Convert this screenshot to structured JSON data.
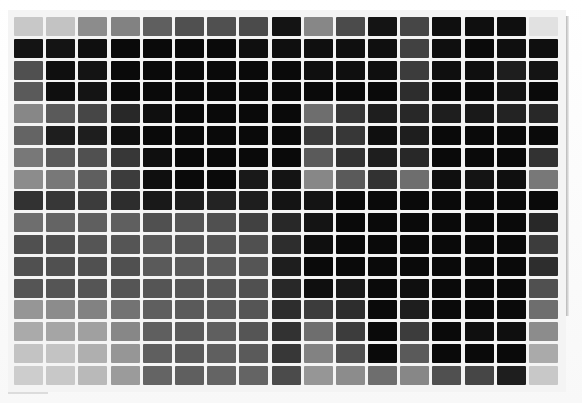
{
  "image": {
    "description": "Grayscale photograph of a printed color chart: a 17 x 17 grid of swatches on white paper",
    "rows": 17,
    "columns": 17,
    "background": "#f6f6f6",
    "gutter_color": "#f4f4f4"
  },
  "swatches": [
    [
      200,
      195,
      140,
      130,
      95,
      80,
      80,
      75,
      20,
      135,
      75,
      20,
      70,
      15,
      15,
      15,
      225
    ],
    [
      20,
      20,
      15,
      10,
      10,
      10,
      10,
      15,
      15,
      15,
      15,
      15,
      65,
      15,
      10,
      15,
      15
    ],
    [
      80,
      15,
      20,
      10,
      10,
      10,
      10,
      10,
      10,
      15,
      15,
      15,
      60,
      15,
      15,
      30,
      20
    ],
    [
      90,
      15,
      20,
      10,
      10,
      10,
      10,
      10,
      10,
      10,
      10,
      10,
      45,
      10,
      10,
      20,
      10
    ],
    [
      135,
      90,
      70,
      40,
      15,
      10,
      10,
      10,
      10,
      110,
      55,
      30,
      40,
      30,
      25,
      35,
      40
    ],
    [
      100,
      30,
      30,
      15,
      10,
      10,
      10,
      10,
      10,
      60,
      55,
      15,
      30,
      10,
      10,
      10,
      10
    ],
    [
      120,
      90,
      80,
      55,
      15,
      10,
      10,
      10,
      10,
      90,
      50,
      30,
      40,
      10,
      10,
      10,
      50
    ],
    [
      140,
      120,
      95,
      60,
      15,
      10,
      10,
      25,
      20,
      135,
      90,
      50,
      110,
      15,
      20,
      15,
      120
    ],
    [
      50,
      55,
      60,
      45,
      25,
      30,
      35,
      30,
      20,
      20,
      10,
      10,
      10,
      10,
      10,
      10,
      10
    ],
    [
      110,
      100,
      95,
      95,
      80,
      85,
      80,
      65,
      40,
      20,
      10,
      10,
      10,
      10,
      10,
      10,
      40
    ],
    [
      80,
      80,
      85,
      85,
      90,
      85,
      85,
      80,
      45,
      15,
      10,
      10,
      10,
      10,
      10,
      10,
      60
    ],
    [
      80,
      80,
      80,
      80,
      90,
      90,
      90,
      85,
      30,
      10,
      10,
      10,
      10,
      10,
      10,
      10,
      45
    ],
    [
      85,
      85,
      85,
      85,
      85,
      85,
      85,
      80,
      40,
      15,
      25,
      10,
      15,
      10,
      10,
      10,
      80
    ],
    [
      150,
      140,
      130,
      115,
      95,
      90,
      90,
      85,
      45,
      60,
      45,
      10,
      30,
      10,
      10,
      10,
      110
    ],
    [
      170,
      165,
      160,
      135,
      95,
      90,
      95,
      85,
      50,
      110,
      60,
      10,
      60,
      10,
      15,
      15,
      140
    ],
    [
      195,
      195,
      175,
      150,
      95,
      90,
      95,
      90,
      55,
      130,
      80,
      10,
      90,
      10,
      10,
      10,
      170
    ],
    [
      205,
      200,
      185,
      155,
      100,
      95,
      100,
      100,
      75,
      150,
      140,
      110,
      135,
      80,
      70,
      30,
      200
    ]
  ]
}
